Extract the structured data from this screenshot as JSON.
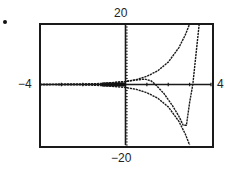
{
  "figure": {
    "marker": "."
  },
  "chart_data": {
    "type": "line",
    "title": "",
    "xlabel": "",
    "ylabel": "",
    "xlim": [
      -4,
      4
    ],
    "ylim": [
      -20,
      20
    ],
    "xscl": 1,
    "yscl": 1,
    "grid": false,
    "window_labels": {
      "ymax": "20",
      "ymin": "-20",
      "xmin": "-4",
      "xmax": "4"
    },
    "series": [
      {
        "name": "upper-envelope",
        "x": [
          -4,
          -3,
          -2,
          -1,
          0,
          0.5,
          1,
          1.5,
          2,
          2.5,
          2.8,
          3.0
        ],
        "y": [
          0.02,
          0.05,
          0.14,
          0.37,
          1,
          1.6,
          2.7,
          4.5,
          7.4,
          12.2,
          16.4,
          20
        ]
      },
      {
        "name": "lower-envelope",
        "x": [
          -4,
          -3,
          -2,
          -1,
          0,
          0.5,
          1,
          1.5,
          2,
          2.5,
          2.8,
          3.0
        ],
        "y": [
          -0.02,
          -0.05,
          -0.14,
          -0.37,
          -1,
          -1.6,
          -2.7,
          -4.5,
          -7.4,
          -12.2,
          -16.4,
          -20
        ]
      },
      {
        "name": "oscillating",
        "x": [
          -4,
          -2,
          -1,
          0,
          0.5,
          0.9,
          1.2,
          1.4,
          1.8,
          2.2,
          2.5,
          2.7,
          2.85,
          3.0,
          3.15,
          3.3,
          3.45
        ],
        "y": [
          0.0,
          0.1,
          0.3,
          1,
          1.5,
          1.8,
          1.2,
          0,
          -3,
          -7,
          -10.5,
          -13.5,
          -13.5,
          -6,
          0,
          10,
          20
        ]
      }
    ]
  }
}
